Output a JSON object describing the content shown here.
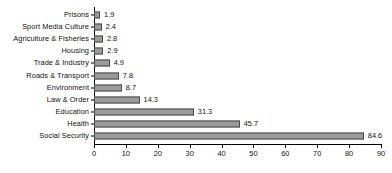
{
  "chart_data": {
    "type": "bar",
    "orientation": "horizontal",
    "title": "",
    "xlabel": "",
    "ylabel": "",
    "xlim": [
      0,
      90
    ],
    "xticks": [
      0,
      10,
      20,
      30,
      40,
      50,
      60,
      70,
      80,
      90
    ],
    "grid": false,
    "legend": null,
    "bar_color": "#9a9a9a",
    "bar_edge_color": "#4a4a4a",
    "axis_color": "#000000",
    "background": "#ffffff",
    "value_label_format": "one-decimal",
    "categories": [
      "Prisons",
      "Sport Media Culture",
      "Agriculture & Fisheries",
      "Housing",
      "Trade & Industry",
      "Roads & Transport",
      "Environment",
      "Law & Order",
      "Education",
      "Health",
      "Social Security"
    ],
    "values": [
      1.9,
      2.4,
      2.8,
      2.9,
      4.9,
      7.8,
      8.7,
      14.3,
      31.3,
      45.7,
      84.6
    ],
    "value_labels": [
      "1.9",
      "2.4",
      "2.8",
      "2.9",
      "4.9",
      "7.8",
      "8.7",
      "14.3",
      "31.3",
      "45.7",
      "84.6"
    ],
    "xtick_labels": [
      "0",
      "10",
      "20",
      "30",
      "40",
      "50",
      "60",
      "70",
      "80",
      "90"
    ]
  }
}
